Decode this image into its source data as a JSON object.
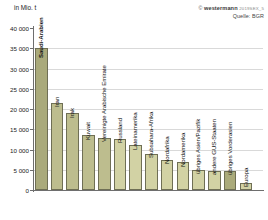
{
  "caption": {
    "unit": "in Mio. t"
  },
  "credit": {
    "copy": "©",
    "brand": "westermann",
    "code": "2019SEX_5",
    "source": "Quelle: BGR"
  },
  "colors": {
    "bar_fill": "#bdbd8e",
    "bar_fill_light": "#d2d2a4",
    "bar_fill_dark": "#aaaa7b",
    "bar_stroke": "#6f6f55",
    "grid": "#d9d9d9",
    "axis": "#6e6e6e",
    "background": "#ffffff"
  },
  "chart_data": {
    "type": "bar",
    "title": "",
    "subtitle": "",
    "xlabel": "",
    "ylabel": "in Mio. t",
    "ylim": [
      0,
      40000
    ],
    "ytick_labels": [
      "40 000",
      "35 000",
      "30 000",
      "25 000",
      "20 000",
      "15 000",
      "10 000",
      "5 000",
      "0"
    ],
    "ytick_values": [
      40000,
      35000,
      30000,
      25000,
      20000,
      15000,
      10000,
      5000,
      0
    ],
    "grid": true,
    "legend": "none",
    "categories": [
      "Saudi-Arabien",
      "Iran",
      "Irak",
      "Kuwait",
      "Vereinigte Arabische Emirate",
      "Russland",
      "Lateinamerika",
      "Subsahara-Afrika",
      "Nordafrika",
      "Nordamerika",
      "übriges Asien/Pazifik",
      "andere GUS-Staaten",
      "übriges Vorderasien",
      "Europa"
    ],
    "values": [
      35000,
      21500,
      19000,
      13500,
      12900,
      12700,
      11000,
      9000,
      7500,
      6800,
      5000,
      4800,
      4700,
      1800
    ],
    "label_placement": [
      "inside",
      "outside",
      "outside",
      "outside",
      "outside",
      "outside",
      "outside",
      "outside",
      "outside",
      "outside",
      "outside",
      "outside",
      "outside",
      "outside"
    ],
    "shade": [
      "dark",
      "normal",
      "normal",
      "normal",
      "normal",
      "light",
      "light",
      "light",
      "light",
      "light",
      "light",
      "light",
      "dark",
      "light"
    ]
  }
}
